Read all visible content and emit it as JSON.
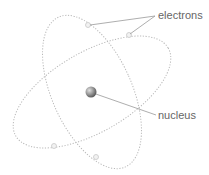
{
  "diagram": {
    "labels": {
      "electrons": "electrons",
      "nucleus": "nucleus"
    },
    "colors": {
      "orbit": "#b8b8b8",
      "leader": "#999999",
      "text": "#666666",
      "nucleus": "#8a8a8a",
      "electron_fill": "#f2f2f2"
    }
  }
}
